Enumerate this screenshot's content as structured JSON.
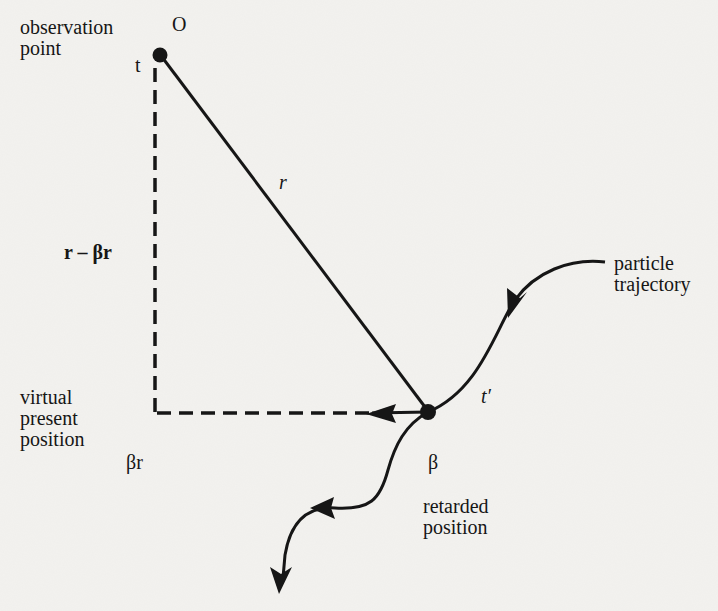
{
  "figure": {
    "labels": {
      "observation_point": "observation\npoint",
      "origin": "O",
      "time_t": "t",
      "r": "r",
      "r_minus_beta_r": "r – βr",
      "virtual_present_position": "virtual\npresent\nposition",
      "beta_r": "βr",
      "beta": "β",
      "retarded_position": "retarded\nposition",
      "t_prime": "t′",
      "particle_trajectory": "particle\ntrajectory"
    },
    "colors": {
      "ink": "#161616",
      "paper": "#f3f2ef"
    }
  }
}
